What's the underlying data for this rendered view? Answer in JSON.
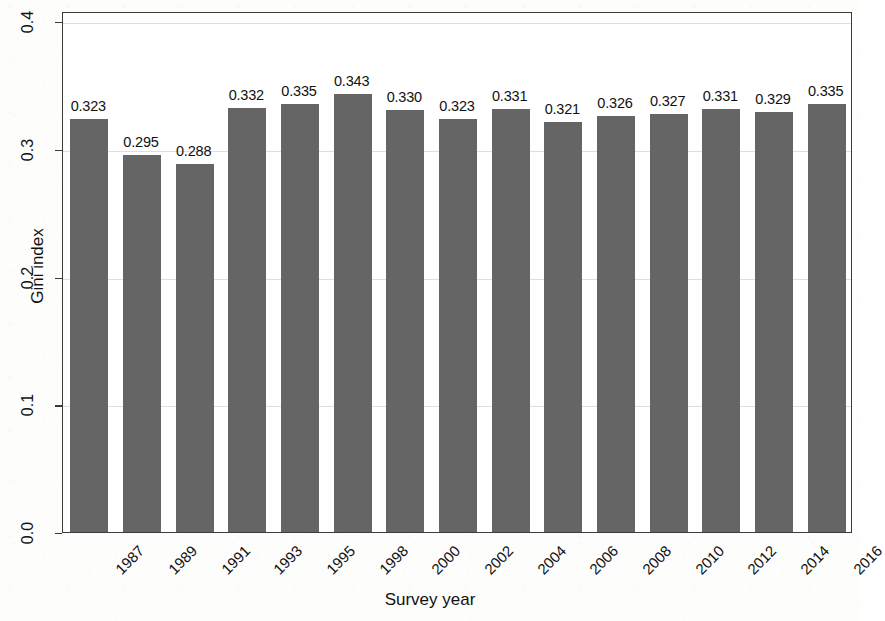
{
  "chart_data": {
    "type": "bar",
    "title": "",
    "xlabel": "Survey year",
    "ylabel": "Gini index",
    "categories": [
      "1987",
      "1989",
      "1991",
      "1993",
      "1995",
      "1998",
      "2000",
      "2002",
      "2004",
      "2006",
      "2008",
      "2010",
      "2012",
      "2014",
      "2016"
    ],
    "values": [
      0.323,
      0.295,
      0.288,
      0.332,
      0.335,
      0.343,
      0.33,
      0.323,
      0.331,
      0.321,
      0.326,
      0.327,
      0.331,
      0.329,
      0.335
    ],
    "value_labels": [
      "0.323",
      "0.295",
      "0.288",
      "0.332",
      "0.335",
      "0.343",
      "0.330",
      "0.323",
      "0.331",
      "0.321",
      "0.326",
      "0.327",
      "0.331",
      "0.329",
      "0.335"
    ],
    "ylim": [
      0.0,
      0.4
    ],
    "yticks": [
      0.0,
      0.1,
      0.2,
      0.3,
      0.4
    ],
    "ytick_labels": [
      "0.0",
      "0.1",
      "0.2",
      "0.3",
      "0.4"
    ],
    "grid": true,
    "legend": "none",
    "bar_color": "#656565",
    "series": [
      {
        "name": "Gini index",
        "values": [
          0.323,
          0.295,
          0.288,
          0.332,
          0.335,
          0.343,
          0.33,
          0.323,
          0.331,
          0.321,
          0.326,
          0.327,
          0.331,
          0.329,
          0.335
        ]
      }
    ]
  },
  "axes": {
    "y_title": "Gini index",
    "x_title": "Survey year"
  },
  "colors": {
    "bar": "#656565",
    "axis": "#3a3a3a",
    "grid": "#dedede",
    "text": "#111111"
  }
}
